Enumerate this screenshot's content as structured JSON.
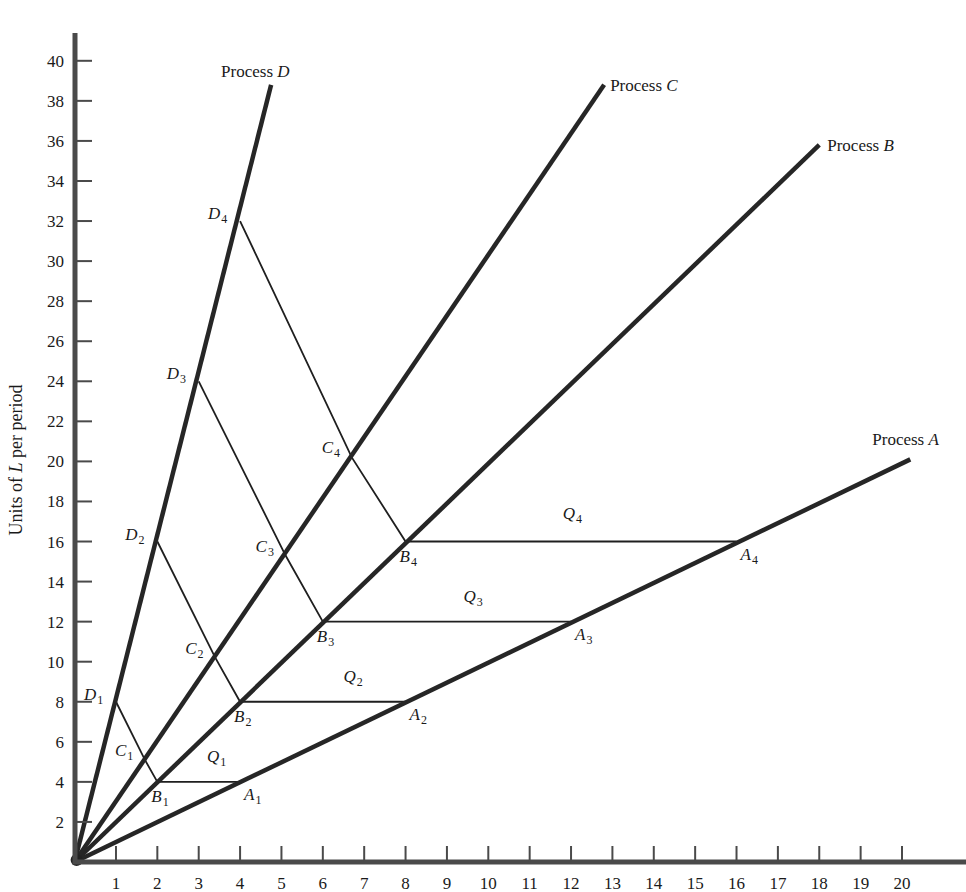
{
  "chart_data": {
    "type": "line",
    "title": "",
    "xlabel": "",
    "ylabel": "Units of L per period",
    "ylabel_italic_part": "L",
    "xlim": [
      0,
      21.5
    ],
    "ylim": [
      0,
      41
    ],
    "x_ticks": [
      1,
      2,
      3,
      4,
      5,
      6,
      7,
      8,
      9,
      10,
      11,
      12,
      13,
      14,
      15,
      16,
      17,
      18,
      19,
      20
    ],
    "y_ticks": [
      2,
      4,
      6,
      8,
      10,
      12,
      14,
      16,
      18,
      20,
      22,
      24,
      26,
      28,
      30,
      32,
      34,
      36,
      38,
      40
    ],
    "grid": false,
    "series": [
      {
        "name": "Process A",
        "label_prefix": "Process ",
        "label_letter": "A",
        "points": [
          [
            0,
            0
          ],
          [
            20.2,
            20.1
          ]
        ]
      },
      {
        "name": "Process B",
        "label_prefix": "Process ",
        "label_letter": "B",
        "points": [
          [
            0,
            0
          ],
          [
            18,
            35.8
          ]
        ]
      },
      {
        "name": "Process C",
        "label_prefix": "Process ",
        "label_letter": "C",
        "points": [
          [
            0,
            0
          ],
          [
            12.8,
            38.8
          ]
        ]
      },
      {
        "name": "Process D",
        "label_prefix": "Process ",
        "label_letter": "D",
        "points": [
          [
            0,
            0
          ],
          [
            4.75,
            38.8
          ]
        ]
      }
    ],
    "labeled_points": [
      {
        "letter": "A",
        "sub": "1",
        "x": 4,
        "y": 4
      },
      {
        "letter": "A",
        "sub": "2",
        "x": 8,
        "y": 8
      },
      {
        "letter": "A",
        "sub": "3",
        "x": 12,
        "y": 12
      },
      {
        "letter": "A",
        "sub": "4",
        "x": 16,
        "y": 16
      },
      {
        "letter": "B",
        "sub": "1",
        "x": 2,
        "y": 4
      },
      {
        "letter": "B",
        "sub": "2",
        "x": 4,
        "y": 8
      },
      {
        "letter": "B",
        "sub": "3",
        "x": 6,
        "y": 12
      },
      {
        "letter": "B",
        "sub": "4",
        "x": 8,
        "y": 16
      },
      {
        "letter": "C",
        "sub": "1",
        "x": 1.7,
        "y": 5.1
      },
      {
        "letter": "C",
        "sub": "2",
        "x": 3.4,
        "y": 10.2
      },
      {
        "letter": "C",
        "sub": "3",
        "x": 5.1,
        "y": 15.3
      },
      {
        "letter": "C",
        "sub": "4",
        "x": 6.7,
        "y": 20.2
      },
      {
        "letter": "D",
        "sub": "1",
        "x": 1,
        "y": 8
      },
      {
        "letter": "D",
        "sub": "2",
        "x": 2,
        "y": 16
      },
      {
        "letter": "D",
        "sub": "3",
        "x": 3,
        "y": 24
      },
      {
        "letter": "D",
        "sub": "4",
        "x": 4,
        "y": 32
      }
    ],
    "isoquants": [
      {
        "name": "Q",
        "sub": "1",
        "path": [
          [
            1,
            8
          ],
          [
            1.7,
            5.1
          ],
          [
            2,
            4
          ],
          [
            4,
            4
          ]
        ],
        "label_pos": [
          3.2,
          5.0
        ]
      },
      {
        "name": "Q",
        "sub": "2",
        "path": [
          [
            2,
            16
          ],
          [
            3.4,
            10.2
          ],
          [
            4,
            8
          ],
          [
            8,
            8
          ]
        ],
        "label_pos": [
          6.5,
          9.0
        ]
      },
      {
        "name": "Q",
        "sub": "3",
        "path": [
          [
            3,
            24
          ],
          [
            5.1,
            15.3
          ],
          [
            6,
            12
          ],
          [
            12,
            12
          ]
        ],
        "label_pos": [
          9.4,
          13.0
        ]
      },
      {
        "name": "Q",
        "sub": "4",
        "path": [
          [
            4,
            32
          ],
          [
            6.7,
            20.2
          ],
          [
            8,
            16
          ],
          [
            16,
            16
          ]
        ],
        "label_pos": [
          11.8,
          17.1
        ]
      }
    ]
  },
  "colors": {
    "axis": "#4a4a4a",
    "ray": "#262626",
    "isoquant": "#1f1f1f",
    "text": "#1a1a1a",
    "background": "#ffffff"
  }
}
